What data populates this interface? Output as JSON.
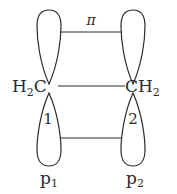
{
  "diagram": {
    "bond_label": "π",
    "left_group": {
      "main": "H",
      "sub": "2",
      "tail": "C"
    },
    "right_group": {
      "main": "CH",
      "sub": "2"
    },
    "lobe_labels": [
      "1",
      "2"
    ],
    "orbitals": [
      {
        "main": "p",
        "sub": "1"
      },
      {
        "main": "p",
        "sub": "2"
      }
    ],
    "colors": {
      "stroke": "#2a2a2a",
      "background": "#ffffff"
    }
  }
}
